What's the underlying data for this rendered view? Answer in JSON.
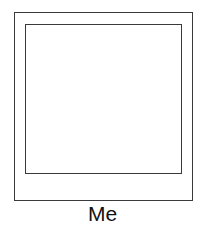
{
  "photo_frame": {
    "caption": "Me",
    "stroke_color": "#3a3a3a"
  }
}
